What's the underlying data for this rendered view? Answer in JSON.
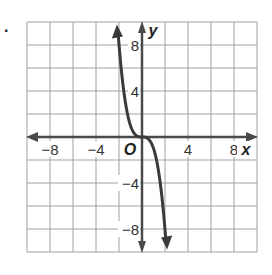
{
  "item_label": ".",
  "chart_data": {
    "type": "line",
    "title": "",
    "function": "y = -x^3",
    "xlabel": "x",
    "ylabel": "y",
    "origin_label": "O",
    "xlim": [
      -10,
      10
    ],
    "ylim": [
      -10,
      10
    ],
    "grid": true,
    "grid_step": 2,
    "x_ticks": [
      {
        "value": -8,
        "label": "−8"
      },
      {
        "value": -4,
        "label": "−4"
      },
      {
        "value": 4,
        "label": "4"
      },
      {
        "value": 8,
        "label": "8"
      }
    ],
    "y_ticks": [
      {
        "value": 8,
        "label": "8"
      },
      {
        "value": 4,
        "label": "4"
      },
      {
        "value": -4,
        "label": "−4"
      },
      {
        "value": -8,
        "label": "−8"
      }
    ],
    "series": [
      {
        "name": "y = -x^3",
        "x": [
          -2.1,
          -1.8,
          -1.5,
          -1.2,
          -1.0,
          -0.7,
          -0.4,
          0,
          0.4,
          0.7,
          1.0,
          1.2,
          1.5,
          1.8,
          2.1
        ],
        "y": [
          9.26,
          5.83,
          3.38,
          1.73,
          1.0,
          0.34,
          0.06,
          0,
          -0.06,
          -0.34,
          -1.0,
          -1.73,
          -3.38,
          -5.83,
          -9.26
        ]
      }
    ],
    "colors": {
      "grid": "#a0a0a0",
      "axes": "#4a4a4a",
      "curve": "#3a3a3a"
    }
  }
}
